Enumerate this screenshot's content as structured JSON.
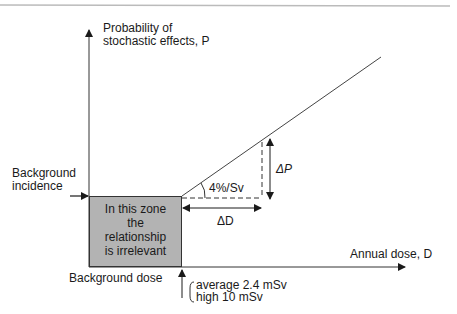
{
  "diagram": {
    "y_axis_label_line1": "Probability of",
    "y_axis_label_line2": "stochastic effects, P",
    "x_axis_label": "Annual dose, D",
    "background_incidence_line1": "Background",
    "background_incidence_line2": "incidence",
    "zone_text": [
      "In this zone",
      "the",
      "relationship",
      "is irrelevant"
    ],
    "slope_label": "4%/Sv",
    "delta_p_label": "ΔP",
    "delta_d_label": "ΔD",
    "background_dose_label": "Background dose",
    "background_dose_average": "average 2.4 mSv",
    "background_dose_high": "high 10 mSv",
    "colors": {
      "zone_fill": "#b3b3b3",
      "line": "#333333",
      "top_rule": "#bbbbbb"
    }
  }
}
